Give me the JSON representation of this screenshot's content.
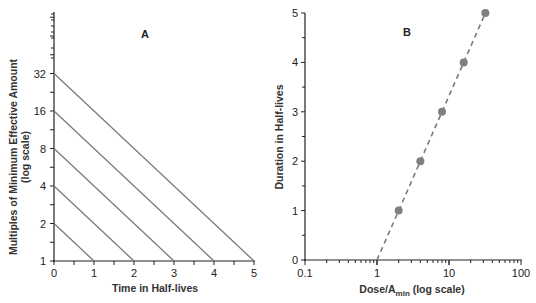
{
  "chart_data": [
    {
      "panel": "A",
      "type": "line",
      "title": "A",
      "xlabel": "Time in Half-lives",
      "ylabel": "Multiples of Minimum Effective Amount",
      "ylabel_sub": "(log scale)",
      "x_ticks": [
        "0",
        "1",
        "2",
        "3",
        "4",
        "5"
      ],
      "y_ticks": [
        "1",
        "2",
        "4",
        "8",
        "16",
        "32"
      ],
      "xlim": [
        0,
        5
      ],
      "ylim": [
        1,
        128
      ],
      "yscale": "log2",
      "grid": false,
      "series": [
        {
          "name": "Dose 2x",
          "x": [
            0,
            1
          ],
          "y": [
            2,
            1
          ]
        },
        {
          "name": "Dose 4x",
          "x": [
            0,
            2
          ],
          "y": [
            4,
            1
          ]
        },
        {
          "name": "Dose 8x",
          "x": [
            0,
            3
          ],
          "y": [
            8,
            1
          ]
        },
        {
          "name": "Dose 16x",
          "x": [
            0,
            4
          ],
          "y": [
            16,
            1
          ]
        },
        {
          "name": "Dose 32x",
          "x": [
            0,
            5
          ],
          "y": [
            32,
            1
          ]
        }
      ]
    },
    {
      "panel": "B",
      "type": "scatter",
      "title": "B",
      "xlabel": "Dose/A",
      "xlabel_sub": "min",
      "xlabel_suffix": " (log scale)",
      "ylabel": "Duration in Half-lives",
      "x_ticks": [
        "0.1",
        "1",
        "10",
        "100"
      ],
      "y_ticks": [
        "0",
        "1",
        "2",
        "3",
        "4",
        "5"
      ],
      "xlim": [
        0.1,
        100
      ],
      "ylim": [
        0,
        5
      ],
      "xscale": "log10",
      "grid": false,
      "series": [
        {
          "name": "Observed",
          "x": [
            2,
            4,
            8,
            16,
            32
          ],
          "y": [
            1,
            2,
            3,
            4,
            5
          ]
        }
      ],
      "fit_line": {
        "style": "dashed",
        "x": [
          1,
          32
        ],
        "y": [
          0,
          5
        ]
      }
    }
  ],
  "colors": {
    "axis": "#222222",
    "line": "#7a7a7a",
    "marker": "#808080"
  }
}
